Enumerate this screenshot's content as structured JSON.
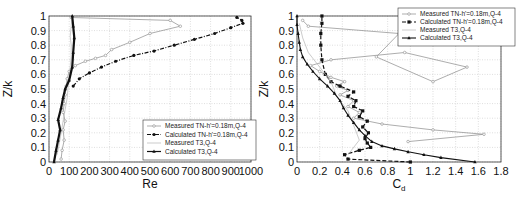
{
  "chart_data": [
    {
      "type": "line",
      "title": "",
      "xlabel": "Re",
      "ylabel": "Z/k",
      "xlim": [
        0,
        1000
      ],
      "ylim": [
        0,
        1
      ],
      "xticks": [
        0,
        100,
        200,
        300,
        400,
        500,
        600,
        700,
        800,
        900,
        1000
      ],
      "yticks": [
        0,
        0.1,
        0.2,
        0.3,
        0.4,
        0.5,
        0.6,
        0.7,
        0.8,
        0.9,
        1
      ],
      "grid": true,
      "legend_position": "lower right",
      "series": [
        {
          "name": "Measured TN-h'=0.18m,Q-4",
          "style": "thin gray line, small open circle markers",
          "color": "#8a8a8a",
          "x": [
            60,
            65,
            75,
            70,
            80,
            70,
            75,
            80,
            85,
            90,
            100,
            130,
            180,
            230,
            280,
            310,
            400,
            500,
            650,
            600,
            110
          ],
          "y": [
            0.02,
            0.08,
            0.15,
            0.22,
            0.28,
            0.34,
            0.4,
            0.46,
            0.52,
            0.57,
            0.62,
            0.66,
            0.69,
            0.71,
            0.73,
            0.77,
            0.82,
            0.88,
            0.93,
            0.97,
            0.99
          ]
        },
        {
          "name": "Calculated TN-h'=0.18m,Q-4",
          "style": "dash-dot black line, filled circle markers",
          "color": "#111111",
          "x": [
            120,
            150,
            200,
            260,
            330,
            420,
            520,
            620,
            720,
            820,
            900,
            960,
            955,
            930
          ],
          "y": [
            0.52,
            0.57,
            0.61,
            0.65,
            0.69,
            0.73,
            0.76,
            0.8,
            0.84,
            0.88,
            0.92,
            0.95,
            0.97,
            0.99
          ]
        },
        {
          "name": "Measured T3,Q-4",
          "style": "thin light gray line",
          "color": "#b5b5b5",
          "x": [
            40,
            50,
            60,
            70,
            80,
            90,
            95,
            100,
            105,
            110,
            110,
            105,
            110,
            115
          ],
          "y": [
            0.05,
            0.12,
            0.2,
            0.28,
            0.36,
            0.44,
            0.52,
            0.58,
            0.65,
            0.72,
            0.8,
            0.86,
            0.93,
            1.0
          ]
        },
        {
          "name": "Calculated T3,Q-4",
          "style": "black line, filled triangle markers (thick, dense)",
          "color": "#111111",
          "x": [
            25,
            35,
            45,
            55,
            45,
            60,
            70,
            80,
            100,
            115,
            120,
            125,
            120,
            115
          ],
          "y": [
            0.0,
            0.08,
            0.15,
            0.22,
            0.29,
            0.37,
            0.44,
            0.5,
            0.56,
            0.65,
            0.75,
            0.85,
            0.93,
            1.0
          ]
        }
      ]
    },
    {
      "type": "line",
      "title": "",
      "xlabel": "C_d",
      "ylabel": "Z/k",
      "xlim": [
        0,
        1.8
      ],
      "ylim": [
        0,
        1
      ],
      "xticks": [
        0,
        0.2,
        0.4,
        0.6,
        0.8,
        1,
        1.2,
        1.4,
        1.6,
        1.8
      ],
      "yticks": [
        0,
        0.1,
        0.2,
        0.3,
        0.4,
        0.5,
        0.6,
        0.7,
        0.8,
        0.9,
        1
      ],
      "grid": true,
      "legend_position": "upper right",
      "series": [
        {
          "name": "Measured TN-h'=0.18m,Q-4",
          "style": "thin gray line, small open circle markers",
          "color": "#8a8a8a",
          "x": [
            0.98,
            1.65,
            1.2,
            0.75,
            0.5,
            0.55,
            0.45,
            0.5,
            0.38,
            0.45,
            0.35,
            0.42,
            0.3,
            0.2,
            0.12,
            0.3,
            0.95,
            1.5,
            1.2,
            0.7,
            0.9,
            0.1,
            0.05
          ],
          "y": [
            0.14,
            0.19,
            0.22,
            0.26,
            0.3,
            0.34,
            0.38,
            0.42,
            0.46,
            0.49,
            0.52,
            0.55,
            0.58,
            0.62,
            0.66,
            0.7,
            0.75,
            0.65,
            0.55,
            0.72,
            0.88,
            0.93,
            0.97
          ]
        },
        {
          "name": "Calculated TN-h'=0.18m,Q-4",
          "style": "dashed black line, filled square markers",
          "color": "#111111",
          "x": [
            1.0,
            0.45,
            0.42,
            0.55,
            0.65,
            0.62,
            0.6,
            0.63,
            0.58,
            0.62,
            0.55,
            0.58,
            0.5,
            0.52,
            0.45,
            0.5,
            0.38,
            0.3,
            0.25,
            0.22,
            0.21,
            0.21,
            0.22,
            0.22
          ],
          "y": [
            0.0,
            0.02,
            0.05,
            0.08,
            0.1,
            0.13,
            0.16,
            0.2,
            0.24,
            0.28,
            0.31,
            0.35,
            0.38,
            0.42,
            0.45,
            0.48,
            0.52,
            0.55,
            0.6,
            0.7,
            0.8,
            0.88,
            0.95,
            1.0
          ]
        },
        {
          "name": "Measured T3,Q-4",
          "style": "thin light gray line",
          "color": "#b5b5b5",
          "x": [
            0.45,
            0.55,
            0.5,
            0.45,
            0.35,
            0.3,
            0.2,
            0.1,
            0.05,
            0.02
          ],
          "y": [
            0.05,
            0.15,
            0.25,
            0.35,
            0.45,
            0.55,
            0.65,
            0.75,
            0.85,
            0.95
          ]
        },
        {
          "name": "Calculated T3,Q-4",
          "style": "black line, filled triangle markers",
          "color": "#111111",
          "x": [
            1.57,
            1.27,
            1.12,
            0.98,
            0.86,
            0.75,
            0.66,
            0.6,
            0.55,
            0.5,
            0.45,
            0.41,
            0.38,
            0.33,
            0.27,
            0.2,
            0.14,
            0.09,
            0.05,
            0.03,
            0.02,
            0.01,
            0.0,
            0.0
          ],
          "y": [
            0.0,
            0.03,
            0.05,
            0.07,
            0.09,
            0.11,
            0.14,
            0.18,
            0.22,
            0.27,
            0.32,
            0.37,
            0.42,
            0.47,
            0.52,
            0.57,
            0.62,
            0.67,
            0.72,
            0.77,
            0.82,
            0.88,
            0.94,
            1.0
          ]
        }
      ]
    }
  ],
  "panels": [
    {
      "xlabel_text": "Re",
      "ylabel_text": "Z/k"
    },
    {
      "xlabel_main": "C",
      "xlabel_sub": "d",
      "ylabel_text": "Z/k"
    }
  ]
}
